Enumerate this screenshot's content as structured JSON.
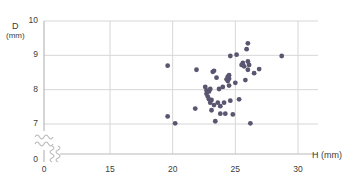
{
  "chart_data": {
    "type": "scatter",
    "title": "",
    "subtitle": "",
    "xlabel": "H (mm)",
    "ylabel": "D (mm)",
    "ylabel_symbol": "D",
    "ylabel_unit": "(mm)",
    "xlabel_symbol": "H",
    "xlabel_unit": "(mm)",
    "xlim": [
      0,
      30
    ],
    "ylim": [
      0,
      10
    ],
    "x_ticks": [
      0,
      15,
      20,
      25,
      30
    ],
    "y_ticks": [
      0,
      7,
      8,
      9,
      10
    ],
    "x_tick_labels": [
      "0",
      "15",
      "20",
      "25",
      "30"
    ],
    "y_tick_labels": [
      "0",
      "7",
      "8",
      "9",
      "10"
    ],
    "x_axis_break": true,
    "y_axis_break": true,
    "axis_break_symbol": "wavy-double-line",
    "grid": true,
    "grid_color": "#d6d6d6",
    "legend": null,
    "legend_position": "none",
    "marker_color": "#5a5570",
    "marker_shape": "circle",
    "marker_size": 3,
    "axis_color": "#b9b9b9",
    "text_color": "#3c3c3c",
    "background": "#ffffff",
    "n_points": 52,
    "points": [
      [
        19.6,
        8.7
      ],
      [
        19.6,
        7.22
      ],
      [
        20.2,
        7.02
      ],
      [
        21.9,
        8.58
      ],
      [
        21.8,
        7.45
      ],
      [
        22.6,
        8.08
      ],
      [
        22.7,
        7.98
      ],
      [
        22.7,
        7.88
      ],
      [
        22.8,
        7.8
      ],
      [
        22.9,
        7.95
      ],
      [
        22.9,
        7.72
      ],
      [
        23.0,
        8.02
      ],
      [
        23.0,
        7.62
      ],
      [
        23.1,
        7.7
      ],
      [
        23.1,
        7.4
      ],
      [
        23.2,
        8.52
      ],
      [
        23.3,
        8.55
      ],
      [
        23.3,
        7.55
      ],
      [
        23.4,
        7.08
      ],
      [
        23.5,
        8.35
      ],
      [
        23.6,
        7.62
      ],
      [
        23.7,
        8.02
      ],
      [
        23.8,
        7.52
      ],
      [
        23.8,
        7.3
      ],
      [
        24.0,
        8.08
      ],
      [
        24.1,
        7.62
      ],
      [
        24.2,
        7.3
      ],
      [
        24.3,
        8.3
      ],
      [
        24.4,
        8.38
      ],
      [
        24.4,
        8.25
      ],
      [
        24.5,
        8.42
      ],
      [
        24.5,
        8.32
      ],
      [
        24.5,
        8.12
      ],
      [
        24.6,
        8.98
      ],
      [
        24.6,
        7.68
      ],
      [
        24.8,
        7.28
      ],
      [
        25.0,
        8.2
      ],
      [
        25.1,
        9.02
      ],
      [
        25.3,
        7.72
      ],
      [
        25.5,
        8.72
      ],
      [
        25.6,
        8.78
      ],
      [
        25.7,
        8.68
      ],
      [
        25.8,
        8.28
      ],
      [
        25.9,
        9.18
      ],
      [
        26.0,
        9.35
      ],
      [
        26.0,
        8.82
      ],
      [
        26.0,
        8.58
      ],
      [
        26.1,
        8.72
      ],
      [
        26.2,
        7.02
      ],
      [
        26.5,
        8.48
      ],
      [
        26.9,
        8.6
      ],
      [
        28.7,
        8.98
      ]
    ]
  }
}
